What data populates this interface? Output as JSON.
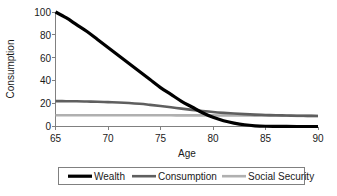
{
  "chart_data": {
    "type": "line",
    "title": "",
    "xlabel": "Age",
    "ylabel": "Consumption",
    "xlim": [
      65,
      90
    ],
    "ylim": [
      0,
      100
    ],
    "xticks": [
      "65",
      "70",
      "75",
      "80",
      "85",
      "90"
    ],
    "yticks": [
      "0",
      "20",
      "40",
      "60",
      "80",
      "100"
    ],
    "grid": false,
    "legend_position": "bottom",
    "x": [
      65,
      66,
      67,
      68,
      69,
      70,
      71,
      72,
      73,
      74,
      75,
      76,
      77,
      78,
      79,
      80,
      81,
      82,
      83,
      84,
      85,
      86,
      87,
      88,
      89,
      90
    ],
    "series": [
      {
        "name": "Wealth",
        "color": "#000000",
        "width": 3.2,
        "values": [
          100,
          95,
          89,
          83,
          76,
          69,
          62,
          55,
          48,
          41,
          34,
          28,
          22,
          17,
          12,
          8,
          5,
          3,
          1.5,
          0.6,
          0.2,
          0.1,
          0.05,
          0.02,
          0,
          0
        ]
      },
      {
        "name": "Consumption",
        "color": "#5f5f5f",
        "width": 2.6,
        "values": [
          22.2,
          22.1,
          22.0,
          21.8,
          21.6,
          21.3,
          21.0,
          20.5,
          19.8,
          18.9,
          17.9,
          16.8,
          15.6,
          14.5,
          13.5,
          12.6,
          11.9,
          11.3,
          10.8,
          10.4,
          10.1,
          9.8,
          9.6,
          9.4,
          9.3,
          9.2
        ]
      },
      {
        "name": "Social Security",
        "color": "#b0b0b0",
        "width": 2.6,
        "values": [
          9.8,
          9.8,
          9.8,
          9.8,
          9.8,
          9.8,
          9.8,
          9.8,
          9.8,
          9.8,
          9.8,
          9.8,
          9.7,
          9.7,
          9.7,
          9.7,
          9.6,
          9.6,
          9.6,
          9.5,
          9.5,
          9.4,
          9.4,
          9.3,
          9.3,
          9.2
        ]
      }
    ],
    "legend": [
      {
        "label": "Wealth",
        "color": "#000000",
        "width": 3.2
      },
      {
        "label": "Consumption",
        "color": "#5f5f5f",
        "width": 2.6
      },
      {
        "label": "Social Security",
        "color": "#b0b0b0",
        "width": 2.6
      }
    ]
  }
}
